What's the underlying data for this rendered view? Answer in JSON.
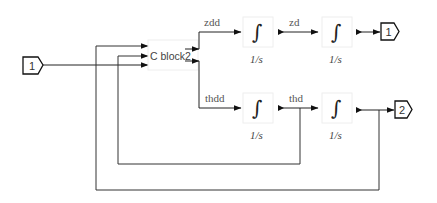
{
  "diagram": {
    "inports": [
      {
        "id": "in1",
        "label": "1"
      }
    ],
    "outports": [
      {
        "id": "out1",
        "label": "1"
      },
      {
        "id": "out2",
        "label": "2"
      }
    ],
    "subsystem": {
      "label": "C block2",
      "inputs": 3,
      "outputs": 2
    },
    "integrators": [
      {
        "id": "int1",
        "symbol": "∫",
        "transfer": "1/s"
      },
      {
        "id": "int2",
        "symbol": "∫",
        "transfer": "1/s"
      },
      {
        "id": "int3",
        "symbol": "∫",
        "transfer": "1/s"
      },
      {
        "id": "int4",
        "symbol": "∫",
        "transfer": "1/s"
      }
    ],
    "signals": {
      "zdd": "zdd",
      "zd": "zd",
      "thdd": "thdd",
      "thd": "thd"
    },
    "colors": {
      "line": "#222222",
      "label": "#555555",
      "background": "#ffffff"
    }
  }
}
